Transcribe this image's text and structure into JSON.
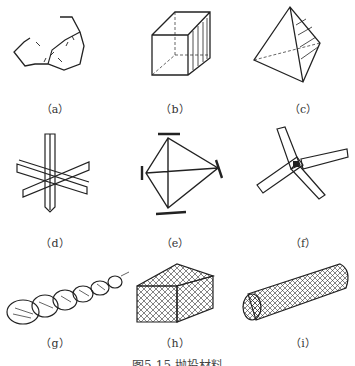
{
  "figures": [
    {
      "id": "a",
      "label": "（a）",
      "shape": "irregular-rock"
    },
    {
      "id": "b",
      "label": "（b）",
      "shape": "rectangular-block"
    },
    {
      "id": "c",
      "label": "（c）",
      "shape": "tetrahedron"
    },
    {
      "id": "d",
      "label": "（d）",
      "shape": "six-arm-cross-block"
    },
    {
      "id": "e",
      "label": "（e）",
      "shape": "tetrapod-frame"
    },
    {
      "id": "f",
      "label": "（f）",
      "shape": "four-leg-block"
    },
    {
      "id": "g",
      "label": "（g）",
      "shape": "brushwood-bundle"
    },
    {
      "id": "h",
      "label": "（h）",
      "shape": "gabion-box"
    },
    {
      "id": "i",
      "label": "（i）",
      "shape": "gabion-cylinder"
    }
  ],
  "caption": "图5-15  抛投材料"
}
